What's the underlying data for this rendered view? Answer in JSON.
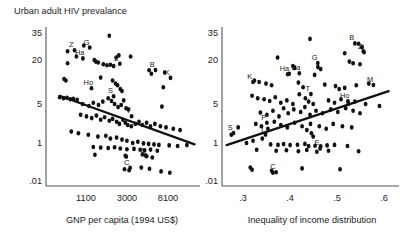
{
  "figure": {
    "title": "Urban adult HIV prevalance",
    "panels": [
      {
        "id": "left",
        "xlabel": "GNP per capita (1994 US$)",
        "ylabel": "",
        "xticks": [
          "1100",
          "3000",
          "8100"
        ],
        "yticks": [
          "35",
          "20",
          "5",
          "1",
          ".01"
        ]
      },
      {
        "id": "right",
        "xlabel": "Inequality of income distribution",
        "ylabel": "",
        "xticks": [
          ".3",
          ".4",
          ".5",
          ".6"
        ],
        "yticks": [
          "35",
          "20",
          "5",
          "1",
          ".01"
        ]
      }
    ]
  },
  "chart_data": [
    {
      "type": "scatter",
      "panel": "left",
      "title": "Urban adult HIV prevalance",
      "xlabel": "GNP per capita (1994 US$)",
      "ylabel": "Urban adult HIV prevalance",
      "xscale": "log",
      "yscale": "log",
      "xticks": [
        1100,
        3000,
        8100
      ],
      "xticklabels": [
        "1100",
        "3000",
        "8100"
      ],
      "yticks": [
        35,
        20,
        5,
        1,
        0.01
      ],
      "yticklabels": [
        "35",
        "20",
        "5",
        "1",
        ".01"
      ],
      "grid": false,
      "legend": null,
      "trendline": {
        "direction": "negative",
        "x0": 700,
        "y0": 6.5,
        "x1": 13000,
        "y1": 0.85
      },
      "annotations": [
        {
          "label": "Z",
          "x": 900,
          "y": 26.0
        },
        {
          "label": "G",
          "x": 1250,
          "y": 27.5
        },
        {
          "label": "Ha",
          "x": 1080,
          "y": 22.0
        },
        {
          "label": "Z",
          "x": 2400,
          "y": 19.5
        },
        {
          "label": "B",
          "x": 5200,
          "y": 16.0
        },
        {
          "label": "K",
          "x": 7200,
          "y": 12.5
        },
        {
          "label": "Ho",
          "x": 1300,
          "y": 9.0
        },
        {
          "label": "S",
          "x": 2100,
          "y": 7.0
        },
        {
          "label": "T",
          "x": 3100,
          "y": 3.4
        },
        {
          "label": "E",
          "x": 4300,
          "y": 0.3
        },
        {
          "label": "C",
          "x": 3000,
          "y": 0.075
        }
      ],
      "points": [
        {
          "x": 2050,
          "y": 33.0
        },
        {
          "x": 1180,
          "y": 27.0
        },
        {
          "x": 830,
          "y": 24.0
        },
        {
          "x": 1005,
          "y": 21.5
        },
        {
          "x": 2380,
          "y": 21.0
        },
        {
          "x": 2520,
          "y": 22.0
        },
        {
          "x": 3250,
          "y": 21.5
        },
        {
          "x": 1480,
          "y": 20.0
        },
        {
          "x": 1530,
          "y": 19.0
        },
        {
          "x": 1610,
          "y": 18.5
        },
        {
          "x": 830,
          "y": 18.0
        },
        {
          "x": 1800,
          "y": 17.5
        },
        {
          "x": 1950,
          "y": 17.0
        },
        {
          "x": 2100,
          "y": 17.2
        },
        {
          "x": 2250,
          "y": 16.5
        },
        {
          "x": 4850,
          "y": 14.5
        },
        {
          "x": 5100,
          "y": 13.0
        },
        {
          "x": 6800,
          "y": 13.5
        },
        {
          "x": 770,
          "y": 11.0
        },
        {
          "x": 800,
          "y": 10.5
        },
        {
          "x": 1700,
          "y": 11.5
        },
        {
          "x": 2200,
          "y": 10.5
        },
        {
          "x": 2350,
          "y": 9.5
        },
        {
          "x": 2450,
          "y": 9.0
        },
        {
          "x": 2600,
          "y": 8.0
        },
        {
          "x": 2700,
          "y": 7.5
        },
        {
          "x": 6600,
          "y": 8.5
        },
        {
          "x": 700,
          "y": 6.2
        },
        {
          "x": 760,
          "y": 6.0
        },
        {
          "x": 820,
          "y": 6.1
        },
        {
          "x": 880,
          "y": 5.8
        },
        {
          "x": 940,
          "y": 5.9
        },
        {
          "x": 1020,
          "y": 5.7
        },
        {
          "x": 1150,
          "y": 5.0
        },
        {
          "x": 1320,
          "y": 4.6
        },
        {
          "x": 1450,
          "y": 5.2
        },
        {
          "x": 1620,
          "y": 4.8
        },
        {
          "x": 1780,
          "y": 5.4
        },
        {
          "x": 2000,
          "y": 6.0
        },
        {
          "x": 2150,
          "y": 5.5
        },
        {
          "x": 2300,
          "y": 5.0
        },
        {
          "x": 2480,
          "y": 4.4
        },
        {
          "x": 2650,
          "y": 4.8
        },
        {
          "x": 2800,
          "y": 5.6
        },
        {
          "x": 2950,
          "y": 4.2
        },
        {
          "x": 3100,
          "y": 4.0
        },
        {
          "x": 6400,
          "y": 4.5
        },
        {
          "x": 1100,
          "y": 3.2
        },
        {
          "x": 1250,
          "y": 3.0
        },
        {
          "x": 1400,
          "y": 2.8
        },
        {
          "x": 1550,
          "y": 3.1
        },
        {
          "x": 1700,
          "y": 2.6
        },
        {
          "x": 1850,
          "y": 2.9
        },
        {
          "x": 2050,
          "y": 2.5
        },
        {
          "x": 2200,
          "y": 2.7
        },
        {
          "x": 2400,
          "y": 2.4
        },
        {
          "x": 2550,
          "y": 2.2
        },
        {
          "x": 2750,
          "y": 2.6
        },
        {
          "x": 2900,
          "y": 2.3
        },
        {
          "x": 3050,
          "y": 2.1
        },
        {
          "x": 3300,
          "y": 2.0
        },
        {
          "x": 3600,
          "y": 2.2
        },
        {
          "x": 3900,
          "y": 2.4
        },
        {
          "x": 4200,
          "y": 2.1
        },
        {
          "x": 4600,
          "y": 2.3
        },
        {
          "x": 5000,
          "y": 2.0
        },
        {
          "x": 5500,
          "y": 2.2
        },
        {
          "x": 6200,
          "y": 2.0
        },
        {
          "x": 7000,
          "y": 1.9
        },
        {
          "x": 8200,
          "y": 1.8
        },
        {
          "x": 9500,
          "y": 1.7
        },
        {
          "x": 900,
          "y": 1.6
        },
        {
          "x": 1050,
          "y": 1.5
        },
        {
          "x": 1300,
          "y": 1.4
        },
        {
          "x": 1600,
          "y": 1.3
        },
        {
          "x": 1900,
          "y": 1.35
        },
        {
          "x": 2100,
          "y": 1.2
        },
        {
          "x": 2400,
          "y": 1.25
        },
        {
          "x": 2700,
          "y": 1.15
        },
        {
          "x": 3000,
          "y": 1.1
        },
        {
          "x": 3400,
          "y": 1.0
        },
        {
          "x": 3800,
          "y": 1.05
        },
        {
          "x": 4300,
          "y": 0.95
        },
        {
          "x": 4800,
          "y": 0.9
        },
        {
          "x": 5400,
          "y": 0.85
        },
        {
          "x": 6000,
          "y": 0.8
        },
        {
          "x": 7500,
          "y": 0.75
        },
        {
          "x": 9000,
          "y": 0.7
        },
        {
          "x": 11000,
          "y": 0.78
        },
        {
          "x": 1450,
          "y": 0.62
        },
        {
          "x": 1700,
          "y": 0.58
        },
        {
          "x": 2000,
          "y": 0.55
        },
        {
          "x": 2300,
          "y": 0.6
        },
        {
          "x": 2600,
          "y": 0.52
        },
        {
          "x": 3000,
          "y": 0.48
        },
        {
          "x": 3500,
          "y": 0.5
        },
        {
          "x": 4000,
          "y": 0.45
        },
        {
          "x": 4400,
          "y": 0.42
        },
        {
          "x": 5000,
          "y": 0.46
        },
        {
          "x": 5800,
          "y": 0.4
        },
        {
          "x": 1500,
          "y": 0.25
        },
        {
          "x": 2900,
          "y": 0.22
        },
        {
          "x": 2960,
          "y": 0.2
        },
        {
          "x": 4200,
          "y": 0.26
        },
        {
          "x": 4500,
          "y": 0.23
        },
        {
          "x": 5200,
          "y": 0.18
        },
        {
          "x": 2850,
          "y": 0.045
        },
        {
          "x": 3150,
          "y": 0.04
        },
        {
          "x": 4100,
          "y": 0.055
        },
        {
          "x": 4900,
          "y": 0.048
        },
        {
          "x": 6300,
          "y": 0.035
        },
        {
          "x": 7600,
          "y": 0.03
        }
      ]
    },
    {
      "type": "scatter",
      "panel": "right",
      "title": "Urban adult HIV prevalance",
      "xlabel": "Inequality of income distribution",
      "ylabel": "Urban adult HIV prevalance",
      "xscale": "linear",
      "yscale": "log",
      "xticks": [
        0.3,
        0.4,
        0.5,
        0.6
      ],
      "xticklabels": [
        ".3",
        ".4",
        ".5",
        ".6"
      ],
      "yticks": [
        35,
        20,
        5,
        1,
        0.01
      ],
      "yticklabels": [
        "35",
        "20",
        "5",
        "1",
        ".01"
      ],
      "grid": false,
      "legend": null,
      "trendline": {
        "direction": "positive",
        "x0": 0.275,
        "y0": 0.78,
        "x1": 0.625,
        "y1": 7.5
      },
      "annotations": [
        {
          "label": "B",
          "x": 0.545,
          "y": 30.0
        },
        {
          "label": "Zi",
          "x": 0.565,
          "y": 25.0
        },
        {
          "label": "G",
          "x": 0.465,
          "y": 20.0
        },
        {
          "label": "Ha",
          "x": 0.4,
          "y": 14.0
        },
        {
          "label": "Za",
          "x": 0.425,
          "y": 14.5
        },
        {
          "label": "K",
          "x": 0.325,
          "y": 11.0
        },
        {
          "label": "M",
          "x": 0.585,
          "y": 10.0
        },
        {
          "label": "T",
          "x": 0.45,
          "y": 7.5
        },
        {
          "label": "Ho",
          "x": 0.53,
          "y": 6.0
        },
        {
          "label": "S",
          "x": 0.283,
          "y": 1.7
        },
        {
          "label": "P",
          "x": 0.355,
          "y": 2.6
        },
        {
          "label": "I",
          "x": 0.352,
          "y": 1.6
        },
        {
          "label": "E",
          "x": 0.47,
          "y": 0.75
        },
        {
          "label": "C",
          "x": 0.375,
          "y": 0.045
        }
      ],
      "points": [
        {
          "x": 0.455,
          "y": 31.0
        },
        {
          "x": 0.56,
          "y": 28.0
        },
        {
          "x": 0.567,
          "y": 26.0
        },
        {
          "x": 0.57,
          "y": 24.0
        },
        {
          "x": 0.53,
          "y": 23.0
        },
        {
          "x": 0.385,
          "y": 21.0
        },
        {
          "x": 0.54,
          "y": 19.0
        },
        {
          "x": 0.548,
          "y": 18.0
        },
        {
          "x": 0.563,
          "y": 17.5
        },
        {
          "x": 0.418,
          "y": 16.5
        },
        {
          "x": 0.422,
          "y": 15.5
        },
        {
          "x": 0.472,
          "y": 16.0
        },
        {
          "x": 0.478,
          "y": 15.0
        },
        {
          "x": 0.41,
          "y": 13.0
        },
        {
          "x": 0.465,
          "y": 12.5
        },
        {
          "x": 0.335,
          "y": 10.5
        },
        {
          "x": 0.345,
          "y": 10.0
        },
        {
          "x": 0.36,
          "y": 9.5
        },
        {
          "x": 0.372,
          "y": 9.0
        },
        {
          "x": 0.43,
          "y": 9.8
        },
        {
          "x": 0.44,
          "y": 8.5
        },
        {
          "x": 0.487,
          "y": 9.2
        },
        {
          "x": 0.51,
          "y": 8.8
        },
        {
          "x": 0.518,
          "y": 8.0
        },
        {
          "x": 0.53,
          "y": 8.3
        },
        {
          "x": 0.555,
          "y": 9.0
        },
        {
          "x": 0.582,
          "y": 9.5
        },
        {
          "x": 0.33,
          "y": 6.5
        },
        {
          "x": 0.342,
          "y": 6.0
        },
        {
          "x": 0.356,
          "y": 5.8
        },
        {
          "x": 0.368,
          "y": 5.5
        },
        {
          "x": 0.38,
          "y": 6.2
        },
        {
          "x": 0.392,
          "y": 5.2
        },
        {
          "x": 0.405,
          "y": 5.6
        },
        {
          "x": 0.418,
          "y": 5.0
        },
        {
          "x": 0.432,
          "y": 6.8
        },
        {
          "x": 0.445,
          "y": 6.0
        },
        {
          "x": 0.452,
          "y": 5.4
        },
        {
          "x": 0.462,
          "y": 5.0
        },
        {
          "x": 0.495,
          "y": 5.6
        },
        {
          "x": 0.508,
          "y": 5.2
        },
        {
          "x": 0.522,
          "y": 5.8
        },
        {
          "x": 0.538,
          "y": 5.0
        },
        {
          "x": 0.552,
          "y": 5.4
        },
        {
          "x": 0.575,
          "y": 5.0
        },
        {
          "x": 0.605,
          "y": 4.6
        },
        {
          "x": 0.348,
          "y": 3.5
        },
        {
          "x": 0.362,
          "y": 3.2
        },
        {
          "x": 0.375,
          "y": 3.8
        },
        {
          "x": 0.388,
          "y": 3.0
        },
        {
          "x": 0.398,
          "y": 4.2
        },
        {
          "x": 0.408,
          "y": 3.4
        },
        {
          "x": 0.42,
          "y": 4.0
        },
        {
          "x": 0.435,
          "y": 3.6
        },
        {
          "x": 0.444,
          "y": 4.4
        },
        {
          "x": 0.455,
          "y": 3.2
        },
        {
          "x": 0.468,
          "y": 3.8
        },
        {
          "x": 0.482,
          "y": 3.4
        },
        {
          "x": 0.5,
          "y": 4.0
        },
        {
          "x": 0.515,
          "y": 3.6
        },
        {
          "x": 0.532,
          "y": 4.2
        },
        {
          "x": 0.548,
          "y": 3.8
        },
        {
          "x": 0.563,
          "y": 3.4
        },
        {
          "x": 0.3,
          "y": 1.9
        },
        {
          "x": 0.338,
          "y": 2.2
        },
        {
          "x": 0.35,
          "y": 2.0
        },
        {
          "x": 0.364,
          "y": 1.8
        },
        {
          "x": 0.378,
          "y": 2.4
        },
        {
          "x": 0.392,
          "y": 2.1
        },
        {
          "x": 0.406,
          "y": 1.9
        },
        {
          "x": 0.422,
          "y": 2.3
        },
        {
          "x": 0.438,
          "y": 2.0
        },
        {
          "x": 0.448,
          "y": 1.7
        },
        {
          "x": 0.456,
          "y": 2.2
        },
        {
          "x": 0.458,
          "y": 1.5
        },
        {
          "x": 0.462,
          "y": 1.3
        },
        {
          "x": 0.475,
          "y": 2.0
        },
        {
          "x": 0.49,
          "y": 1.8
        },
        {
          "x": 0.505,
          "y": 2.2
        },
        {
          "x": 0.525,
          "y": 2.0
        },
        {
          "x": 0.545,
          "y": 1.9
        },
        {
          "x": 0.285,
          "y": 1.4
        },
        {
          "x": 0.318,
          "y": 1.0
        },
        {
          "x": 0.332,
          "y": 1.1
        },
        {
          "x": 0.352,
          "y": 1.2
        },
        {
          "x": 0.37,
          "y": 0.85
        },
        {
          "x": 0.386,
          "y": 0.8
        },
        {
          "x": 0.398,
          "y": 0.88
        },
        {
          "x": 0.412,
          "y": 0.78
        },
        {
          "x": 0.428,
          "y": 0.82
        },
        {
          "x": 0.444,
          "y": 0.9
        },
        {
          "x": 0.452,
          "y": 0.7
        },
        {
          "x": 0.466,
          "y": 0.72
        },
        {
          "x": 0.478,
          "y": 0.68
        },
        {
          "x": 0.492,
          "y": 0.75
        },
        {
          "x": 0.508,
          "y": 0.8
        },
        {
          "x": 0.536,
          "y": 0.7
        },
        {
          "x": 0.34,
          "y": 0.45
        },
        {
          "x": 0.382,
          "y": 0.4
        },
        {
          "x": 0.404,
          "y": 0.42
        },
        {
          "x": 0.43,
          "y": 0.38
        },
        {
          "x": 0.448,
          "y": 0.44
        },
        {
          "x": 0.47,
          "y": 0.36
        },
        {
          "x": 0.495,
          "y": 0.4
        },
        {
          "x": 0.56,
          "y": 0.38
        },
        {
          "x": 0.326,
          "y": 0.055
        },
        {
          "x": 0.33,
          "y": 0.042
        },
        {
          "x": 0.372,
          "y": 0.038
        },
        {
          "x": 0.375,
          "y": 0.03
        },
        {
          "x": 0.438,
          "y": 0.05
        },
        {
          "x": 0.52,
          "y": 0.045
        }
      ]
    }
  ]
}
